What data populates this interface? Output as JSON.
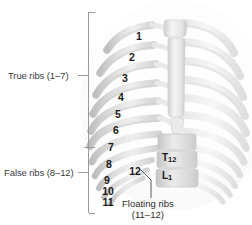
{
  "figure": {
    "background_color": "#ffffff",
    "bone_color": "#e3e3e3",
    "bone_shadow_color": "#c6c6c6",
    "label_color": "#1a1a1a"
  },
  "brackets": {
    "true_ribs": {
      "label": "True ribs (1–7)",
      "range_start": 1,
      "range_end": 7
    },
    "false_ribs": {
      "label": "False ribs (8–12)",
      "range_start": 8,
      "range_end": 12
    }
  },
  "rib_numbers": [
    {
      "label": "1",
      "x": 138,
      "y": 37
    },
    {
      "label": "2",
      "x": 131,
      "y": 58
    },
    {
      "label": "3",
      "x": 124,
      "y": 79
    },
    {
      "label": "4",
      "x": 120,
      "y": 98
    },
    {
      "label": "5",
      "x": 117,
      "y": 115
    },
    {
      "label": "6",
      "x": 115,
      "y": 131
    },
    {
      "label": "7",
      "x": 110,
      "y": 148
    },
    {
      "label": "8",
      "x": 108,
      "y": 165
    },
    {
      "label": "9",
      "x": 106,
      "y": 181
    },
    {
      "label": "10",
      "x": 108,
      "y": 192
    },
    {
      "label": "11",
      "x": 108,
      "y": 203
    }
  ],
  "floating_rib_callout": {
    "label": "12",
    "x": 133,
    "y": 172
  },
  "vertebrae": [
    {
      "letter": "T",
      "number": "12",
      "x": 162,
      "y": 153
    },
    {
      "letter": "L",
      "number": "1",
      "x": 162,
      "y": 171
    }
  ],
  "caption": {
    "line1": "Floating ribs",
    "line2": "(11–12)"
  }
}
